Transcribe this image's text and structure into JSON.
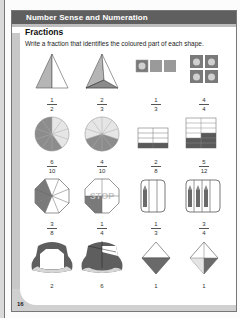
{
  "header": {
    "section_title": "Number Sense and Numeration",
    "lesson_title": "Fractions",
    "instruction": "Write a fraction that identifies the coloured part of each shape."
  },
  "page_number": "16",
  "rows": [
    {
      "items": [
        {
          "shape": "triangle-pyramid-half",
          "numerator": "1",
          "denominator": "2"
        },
        {
          "shape": "triangle-pyramid-thirds",
          "numerator": "2",
          "denominator": "3"
        },
        {
          "shape": "three-squares-one-apple",
          "numerator": "1",
          "denominator": "3"
        },
        {
          "shape": "four-squares-apples",
          "numerator": "4",
          "denominator": "4"
        }
      ]
    },
    {
      "items": [
        {
          "shape": "pizza-ten-slices-six",
          "numerator": "6",
          "denominator": "10"
        },
        {
          "shape": "pizza-ten-slices-four",
          "numerator": "4",
          "denominator": "10"
        },
        {
          "shape": "grid-eight-two",
          "numerator": "2",
          "denominator": "8"
        },
        {
          "shape": "grid-twelve-five",
          "numerator": "5",
          "denominator": "12"
        }
      ]
    },
    {
      "items": [
        {
          "shape": "stop-sign-eighths",
          "numerator": "3",
          "denominator": "8"
        },
        {
          "shape": "stop-sign-quarters",
          "numerator": "1",
          "denominator": "4"
        },
        {
          "shape": "pencil-box-three",
          "numerator": "1",
          "denominator": "3"
        },
        {
          "shape": "pencil-box-four",
          "numerator": "3",
          "denominator": "4"
        }
      ]
    },
    {
      "items": [
        {
          "shape": "cake-ring-thirds",
          "numerator": "2",
          "denominator": "3"
        },
        {
          "shape": "cake-eighths",
          "numerator": "6",
          "denominator": "8"
        },
        {
          "shape": "diamond-half",
          "numerator": "1",
          "denominator": "2"
        },
        {
          "shape": "diamond-quarter",
          "numerator": "1",
          "denominator": "4"
        }
      ]
    }
  ],
  "colors": {
    "header_bar": "#5f5f5f",
    "shade": "#6a6a6a",
    "light_shade": "#bfbfbf"
  }
}
